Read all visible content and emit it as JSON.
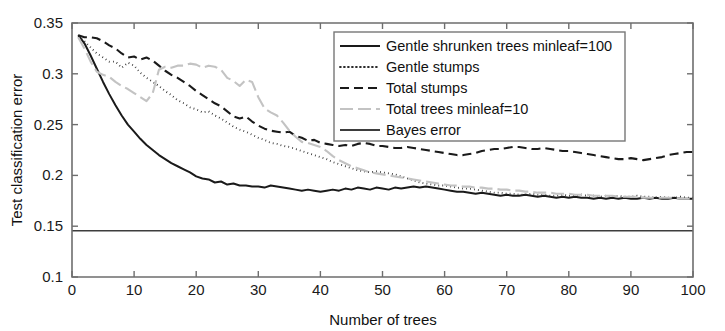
{
  "chart_data": {
    "type": "line",
    "title": "",
    "xlabel": "Number of trees",
    "ylabel": "Test classification error",
    "xlim": [
      0,
      100
    ],
    "ylim": [
      0.1,
      0.35
    ],
    "xticks": [
      0,
      10,
      20,
      30,
      40,
      50,
      60,
      70,
      80,
      90,
      100
    ],
    "xtick_labels": [
      "0",
      "10",
      "20",
      "30",
      "40",
      "50",
      "60",
      "70",
      "80",
      "90",
      "100"
    ],
    "yticks": [
      0.1,
      0.15,
      0.2,
      0.25,
      0.3,
      0.35
    ],
    "ytick_labels": [
      "0.1",
      "0.15",
      "0.2",
      "0.25",
      "0.3",
      "0.35"
    ],
    "grid": false,
    "legend_position": "upper-center-right",
    "series": [
      {
        "name": "Gentle shrunken trees minleaf=100",
        "style": "solid",
        "color": "#1a1a1a",
        "width": 2.0,
        "x": [
          1,
          2,
          3,
          4,
          5,
          6,
          7,
          8,
          9,
          10,
          11,
          12,
          13,
          14,
          15,
          16,
          17,
          18,
          19,
          20,
          21,
          22,
          23,
          24,
          25,
          26,
          27,
          28,
          29,
          30,
          31,
          32,
          33,
          34,
          35,
          36,
          37,
          38,
          39,
          40,
          41,
          42,
          43,
          44,
          45,
          46,
          47,
          48,
          49,
          50,
          51,
          52,
          53,
          54,
          55,
          56,
          57,
          58,
          59,
          60,
          61,
          62,
          63,
          64,
          65,
          66,
          67,
          68,
          69,
          70,
          71,
          72,
          73,
          74,
          75,
          76,
          77,
          78,
          79,
          80,
          81,
          82,
          83,
          84,
          85,
          86,
          87,
          88,
          89,
          90,
          91,
          92,
          93,
          94,
          95,
          96,
          97,
          98,
          99,
          100
        ],
        "values": [
          0.338,
          0.33,
          0.318,
          0.305,
          0.292,
          0.28,
          0.269,
          0.259,
          0.25,
          0.243,
          0.236,
          0.23,
          0.225,
          0.22,
          0.216,
          0.212,
          0.209,
          0.206,
          0.203,
          0.199,
          0.197,
          0.196,
          0.193,
          0.194,
          0.191,
          0.192,
          0.19,
          0.19,
          0.189,
          0.189,
          0.188,
          0.19,
          0.189,
          0.188,
          0.187,
          0.186,
          0.185,
          0.186,
          0.185,
          0.184,
          0.185,
          0.186,
          0.185,
          0.187,
          0.186,
          0.188,
          0.187,
          0.186,
          0.188,
          0.187,
          0.186,
          0.188,
          0.187,
          0.188,
          0.189,
          0.188,
          0.189,
          0.188,
          0.187,
          0.186,
          0.185,
          0.184,
          0.184,
          0.183,
          0.182,
          0.183,
          0.182,
          0.181,
          0.18,
          0.181,
          0.18,
          0.18,
          0.181,
          0.18,
          0.179,
          0.18,
          0.179,
          0.178,
          0.179,
          0.178,
          0.179,
          0.178,
          0.178,
          0.177,
          0.178,
          0.177,
          0.178,
          0.177,
          0.178,
          0.177,
          0.177,
          0.178,
          0.177,
          0.178,
          0.177,
          0.177,
          0.178,
          0.177,
          0.177,
          0.177
        ]
      },
      {
        "name": "Gentle stumps",
        "style": "dotted",
        "color": "#2b2b2b",
        "width": 1.9,
        "x": [
          1,
          2,
          3,
          4,
          5,
          6,
          7,
          8,
          9,
          10,
          11,
          12,
          13,
          14,
          15,
          16,
          17,
          18,
          19,
          20,
          21,
          22,
          23,
          24,
          25,
          26,
          27,
          28,
          29,
          30,
          31,
          32,
          33,
          34,
          35,
          36,
          37,
          38,
          39,
          40,
          41,
          42,
          43,
          44,
          45,
          46,
          47,
          48,
          49,
          50,
          51,
          52,
          53,
          54,
          55,
          56,
          57,
          58,
          59,
          60,
          61,
          62,
          63,
          64,
          65,
          66,
          67,
          68,
          69,
          70,
          71,
          72,
          73,
          74,
          75,
          76,
          77,
          78,
          79,
          80,
          81,
          82,
          83,
          84,
          85,
          86,
          87,
          88,
          89,
          90,
          91,
          92,
          93,
          94,
          95,
          96,
          97,
          98,
          99,
          100
        ],
        "values": [
          0.337,
          0.332,
          0.326,
          0.32,
          0.316,
          0.312,
          0.312,
          0.306,
          0.311,
          0.308,
          0.301,
          0.296,
          0.292,
          0.288,
          0.283,
          0.279,
          0.274,
          0.271,
          0.267,
          0.265,
          0.262,
          0.263,
          0.259,
          0.256,
          0.252,
          0.248,
          0.245,
          0.243,
          0.24,
          0.237,
          0.235,
          0.232,
          0.231,
          0.229,
          0.228,
          0.226,
          0.224,
          0.222,
          0.22,
          0.218,
          0.216,
          0.213,
          0.211,
          0.209,
          0.207,
          0.205,
          0.204,
          0.203,
          0.204,
          0.203,
          0.202,
          0.201,
          0.199,
          0.197,
          0.195,
          0.193,
          0.192,
          0.191,
          0.19,
          0.19,
          0.189,
          0.188,
          0.187,
          0.187,
          0.186,
          0.185,
          0.184,
          0.183,
          0.183,
          0.182,
          0.182,
          0.181,
          0.181,
          0.182,
          0.181,
          0.181,
          0.18,
          0.18,
          0.181,
          0.18,
          0.18,
          0.181,
          0.18,
          0.18,
          0.179,
          0.18,
          0.179,
          0.18,
          0.179,
          0.179,
          0.18,
          0.179,
          0.179,
          0.178,
          0.179,
          0.178,
          0.178,
          0.179,
          0.178,
          0.178
        ]
      },
      {
        "name": "Total stumps",
        "style": "dashed",
        "color": "#1a1a1a",
        "width": 2.1,
        "x": [
          1,
          2,
          3,
          4,
          5,
          6,
          7,
          8,
          9,
          10,
          11,
          12,
          13,
          14,
          15,
          16,
          17,
          18,
          19,
          20,
          21,
          22,
          23,
          24,
          25,
          26,
          27,
          28,
          29,
          30,
          31,
          32,
          33,
          34,
          35,
          36,
          37,
          38,
          39,
          40,
          41,
          42,
          43,
          44,
          45,
          46,
          47,
          48,
          49,
          50,
          51,
          52,
          53,
          54,
          55,
          56,
          57,
          58,
          59,
          60,
          61,
          62,
          63,
          64,
          65,
          66,
          67,
          68,
          69,
          70,
          71,
          72,
          73,
          74,
          75,
          76,
          77,
          78,
          79,
          80,
          81,
          82,
          83,
          84,
          85,
          86,
          87,
          88,
          89,
          90,
          91,
          92,
          93,
          94,
          95,
          96,
          97,
          98,
          99,
          100
        ],
        "values": [
          0.338,
          0.336,
          0.336,
          0.335,
          0.332,
          0.328,
          0.325,
          0.32,
          0.316,
          0.317,
          0.314,
          0.316,
          0.313,
          0.308,
          0.303,
          0.299,
          0.296,
          0.292,
          0.288,
          0.283,
          0.279,
          0.275,
          0.271,
          0.268,
          0.263,
          0.258,
          0.256,
          0.258,
          0.253,
          0.249,
          0.246,
          0.244,
          0.243,
          0.242,
          0.243,
          0.239,
          0.237,
          0.234,
          0.235,
          0.232,
          0.231,
          0.23,
          0.229,
          0.23,
          0.229,
          0.231,
          0.232,
          0.231,
          0.229,
          0.229,
          0.228,
          0.227,
          0.227,
          0.228,
          0.227,
          0.226,
          0.225,
          0.224,
          0.223,
          0.222,
          0.221,
          0.22,
          0.22,
          0.221,
          0.222,
          0.224,
          0.225,
          0.226,
          0.226,
          0.227,
          0.228,
          0.228,
          0.227,
          0.226,
          0.226,
          0.227,
          0.226,
          0.225,
          0.224,
          0.224,
          0.223,
          0.222,
          0.221,
          0.22,
          0.219,
          0.218,
          0.217,
          0.216,
          0.216,
          0.217,
          0.216,
          0.215,
          0.216,
          0.217,
          0.218,
          0.22,
          0.221,
          0.222,
          0.223,
          0.223
        ]
      },
      {
        "name": "Total trees minleaf=10",
        "style": "dashdot",
        "color": "#c3c3c3",
        "width": 2.1,
        "x": [
          1,
          2,
          3,
          4,
          5,
          6,
          7,
          8,
          9,
          10,
          11,
          12,
          13,
          14,
          15,
          16,
          17,
          18,
          19,
          20,
          21,
          22,
          23,
          24,
          25,
          26,
          27,
          28,
          29,
          30,
          31,
          32,
          33,
          34,
          35,
          36,
          37,
          38,
          39,
          40,
          41,
          42,
          43,
          44,
          45,
          46,
          47,
          48,
          49,
          50,
          51,
          52,
          53,
          54,
          55,
          56,
          57,
          58,
          59,
          60,
          61,
          62,
          63,
          64,
          65,
          66,
          67,
          68,
          69,
          70,
          71,
          72,
          73,
          74,
          75,
          76,
          77,
          78,
          79,
          80,
          81,
          82,
          83,
          84,
          85,
          86,
          87,
          88,
          89,
          90,
          91,
          92,
          93,
          94,
          95,
          96,
          97,
          98,
          99,
          100
        ],
        "values": [
          0.336,
          0.325,
          0.312,
          0.302,
          0.299,
          0.297,
          0.292,
          0.288,
          0.285,
          0.281,
          0.277,
          0.273,
          0.281,
          0.304,
          0.307,
          0.306,
          0.308,
          0.308,
          0.31,
          0.309,
          0.306,
          0.308,
          0.307,
          0.304,
          0.296,
          0.293,
          0.288,
          0.294,
          0.292,
          0.277,
          0.266,
          0.262,
          0.259,
          0.252,
          0.244,
          0.238,
          0.233,
          0.232,
          0.23,
          0.228,
          0.224,
          0.219,
          0.215,
          0.212,
          0.209,
          0.207,
          0.205,
          0.203,
          0.202,
          0.201,
          0.2,
          0.199,
          0.198,
          0.197,
          0.196,
          0.195,
          0.194,
          0.193,
          0.192,
          0.191,
          0.19,
          0.19,
          0.189,
          0.189,
          0.188,
          0.188,
          0.187,
          0.187,
          0.186,
          0.186,
          0.185,
          0.185,
          0.184,
          0.184,
          0.183,
          0.183,
          0.183,
          0.182,
          0.182,
          0.182,
          0.181,
          0.181,
          0.181,
          0.18,
          0.18,
          0.18,
          0.18,
          0.179,
          0.179,
          0.179,
          0.179,
          0.178,
          0.178,
          0.178,
          0.178,
          0.178,
          0.178,
          0.177,
          0.177,
          0.177
        ]
      },
      {
        "name": "Bayes error",
        "style": "solid",
        "color": "#3d3d3d",
        "width": 1.5,
        "x": [
          0,
          100
        ],
        "values": [
          0.1455,
          0.1455
        ]
      }
    ],
    "legend_entries": [
      {
        "label": "Gentle shrunken trees minleaf=100",
        "style": "solid",
        "color": "#1a1a1a"
      },
      {
        "label": "Gentle stumps",
        "style": "dotted",
        "color": "#2b2b2b"
      },
      {
        "label": "Total stumps",
        "style": "dashed",
        "color": "#1a1a1a"
      },
      {
        "label": "Total trees minleaf=10",
        "style": "dashdot",
        "color": "#c3c3c3"
      },
      {
        "label": "Bayes error",
        "style": "solid",
        "color": "#3d3d3d"
      }
    ]
  },
  "axes": {
    "x_title": "Number of trees",
    "y_title": "Test classification error"
  }
}
